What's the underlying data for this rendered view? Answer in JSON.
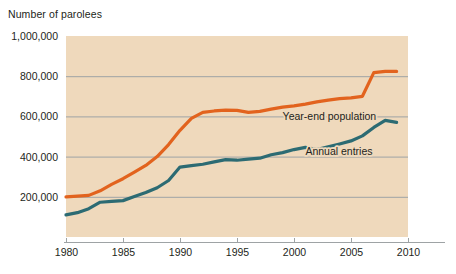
{
  "chart_data": {
    "type": "line",
    "title": "",
    "ylabel": "Number of parolees",
    "xlabel": "",
    "xlim": [
      1980,
      2010
    ],
    "ylim": [
      0,
      1000000
    ],
    "grid": true,
    "legend_position": "inline-right",
    "ytick_labels": [
      "200,000",
      "400,000",
      "600,000",
      "800,000",
      "1,000,000"
    ],
    "ytick_values": [
      200000,
      400000,
      600000,
      800000,
      1000000
    ],
    "xtick_labels": [
      "1980",
      "1985",
      "1990",
      "1995",
      "2000",
      "2005",
      "2010"
    ],
    "xtick_values": [
      1980,
      1985,
      1990,
      1995,
      2000,
      2005,
      2010
    ],
    "x": [
      1980,
      1981,
      1982,
      1983,
      1984,
      1985,
      1986,
      1987,
      1988,
      1989,
      1990,
      1991,
      1992,
      1993,
      1994,
      1995,
      1996,
      1997,
      1998,
      1999,
      2000,
      2001,
      2002,
      2003,
      2004,
      2005,
      2006,
      2007,
      2008,
      2009
    ],
    "series": [
      {
        "name": "Year-end population",
        "color": "#E2631E",
        "label_x": 1999.0,
        "label_y": 600000,
        "values": [
          200000,
          203000,
          207000,
          230000,
          262000,
          290000,
          323000,
          356000,
          400000,
          460000,
          531000,
          590000,
          620000,
          627000,
          631000,
          630000,
          620000,
          625000,
          636000,
          646000,
          652000,
          661000,
          672000,
          681000,
          688000,
          692000,
          700000,
          818000,
          824000,
          824000
        ]
      },
      {
        "name": "Annual entries",
        "color": "#2C6B73",
        "label_x": 2001.0,
        "label_y": 430000,
        "values": [
          110000,
          121000,
          141000,
          173000,
          177000,
          181000,
          201000,
          221000,
          245000,
          281000,
          348000,
          355000,
          362000,
          374000,
          385000,
          382000,
          387000,
          392000,
          409000,
          420000,
          435000,
          446000,
          435000,
          449000,
          463000,
          478000,
          503000,
          545000,
          580000,
          570000
        ]
      }
    ]
  },
  "plot_geometry": {
    "left": 66,
    "right": 408,
    "axis_right": 445,
    "top": 36,
    "bottom": 237,
    "band_color": "#EFD9BC",
    "grid_color": "#9ea3a5",
    "axis_color": "#9ea3a5"
  }
}
